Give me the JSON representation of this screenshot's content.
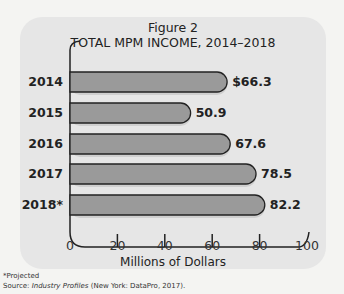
{
  "figure": {
    "label": "Figure 2",
    "title": "TOTAL MPM INCOME, 2014–2018",
    "xlabel": "Millions of Dollars",
    "footnote": "*Projected",
    "source_prefix": "Source: ",
    "source_title": "Industry Profiles",
    "source_suffix": " (New York: DataPro, 2017)."
  },
  "bars": [
    {
      "year": "2014",
      "value_label": "$66.3"
    },
    {
      "year": "2015",
      "value_label": "50.9"
    },
    {
      "year": "2016",
      "value_label": "67.6"
    },
    {
      "year": "2017",
      "value_label": "78.5"
    },
    {
      "year": "2018*",
      "value_label": "82.2"
    }
  ],
  "ticks": [
    "0",
    "20",
    "40",
    "60",
    "80",
    "100"
  ],
  "colors": {
    "bar_fill": "#9a9a9a",
    "bar_stroke": "#222222",
    "panel": "#e6e6e6"
  },
  "chart_data": {
    "type": "bar",
    "orientation": "horizontal",
    "categories": [
      "2014",
      "2015",
      "2016",
      "2017",
      "2018*"
    ],
    "values": [
      66.3,
      50.9,
      67.6,
      78.5,
      82.2
    ],
    "xlabel": "Millions of Dollars",
    "ylabel": "",
    "xlim": [
      0,
      100
    ],
    "xticks": [
      0,
      20,
      40,
      60,
      80,
      100
    ],
    "grid": false,
    "legend": null,
    "annotations": [
      "*Projected",
      "Source: Industry Profiles (New York: DataPro, 2017)."
    ]
  }
}
